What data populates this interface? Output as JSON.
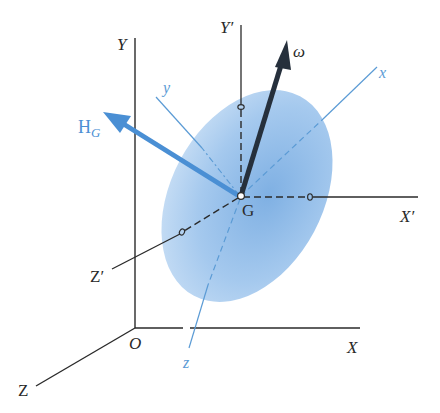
{
  "figure": {
    "labels": {
      "fixed_axes": {
        "X": "X",
        "Y": "Y",
        "Z": "Z",
        "origin": "O"
      },
      "centroidal_axes": {
        "X_prime": "X′",
        "Y_prime": "Y′",
        "Z_prime": "Z′"
      },
      "body_axes": {
        "x": "x",
        "y": "y",
        "z": "z"
      },
      "center": "G",
      "angular_velocity": "ω",
      "angular_momentum": {
        "main": "H",
        "subscript": "G"
      }
    },
    "colors": {
      "axis_black": "#2a2a2a",
      "body_axis_blue": "#5b9bd5",
      "momentum_blue": "#4a8fd4",
      "omega_dark": "#26303c",
      "body_fill": "#9cc3ea",
      "body_fill_light": "#cfe2f6"
    }
  }
}
